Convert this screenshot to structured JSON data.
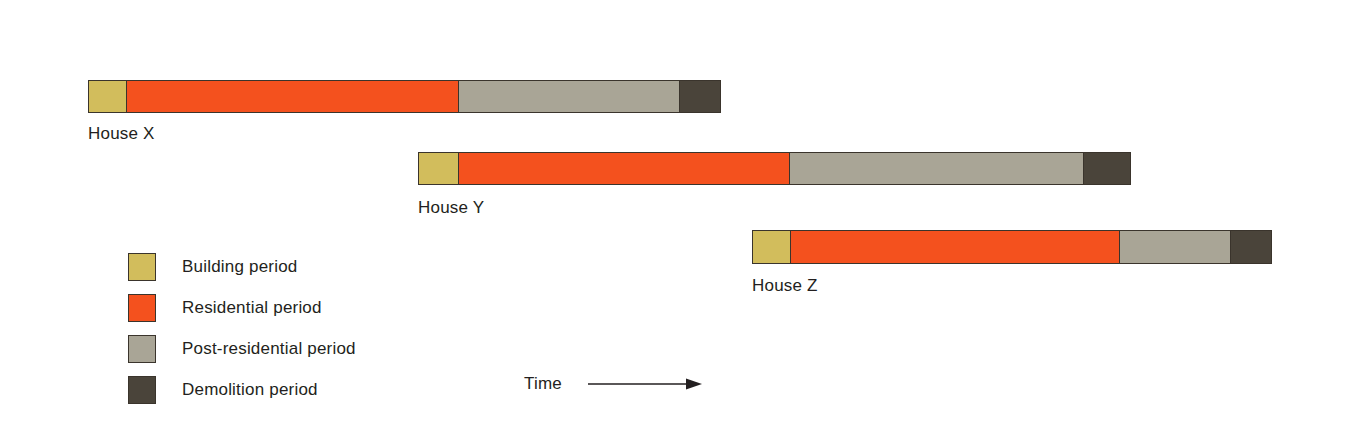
{
  "figure": {
    "time_axis_label": "Time",
    "time_arrow_icon": "right-arrow-icon"
  },
  "colors": {
    "building": "#d2bd5c",
    "residential": "#f4511e",
    "post_residential": "#a9a596",
    "demolition": "#4a443a",
    "outline": "#3a342c",
    "frame": "#5a5a5a",
    "text": "#231f20",
    "background": "#ffffff"
  },
  "legend": {
    "items": [
      {
        "label": "Building period",
        "color": "#d2bd5c",
        "key": "building"
      },
      {
        "label": "Residential period",
        "color": "#f4511e",
        "key": "residential"
      },
      {
        "label": "Post-residential period",
        "color": "#a9a596",
        "key": "post-residential"
      },
      {
        "label": "Demolition period",
        "color": "#4a443a",
        "key": "demolition"
      }
    ]
  },
  "chart_data": {
    "type": "bar",
    "subtype": "stacked-horizontal-timeline",
    "xlabel": "Time",
    "ylabel": "",
    "grid": false,
    "legend_position": "left",
    "axis_units": "pixels",
    "categories": [
      "House X",
      "House Y",
      "House Z"
    ],
    "segment_names": [
      "Building period",
      "Residential period",
      "Post-residential period",
      "Demolition period"
    ],
    "bars": [
      {
        "label": "House X",
        "start": 88,
        "end": 721,
        "top": 80,
        "height": 33,
        "label_x": 88,
        "label_y": 124,
        "segments": [
          {
            "name": "Building period",
            "start": 88,
            "end": 126,
            "width": 38,
            "color": "#d2bd5c"
          },
          {
            "name": "Residential period",
            "start": 126,
            "end": 459,
            "width": 333,
            "color": "#f4511e"
          },
          {
            "name": "Post-residential period",
            "start": 459,
            "end": 681,
            "width": 222,
            "color": "#a9a596"
          },
          {
            "name": "Demolition period",
            "start": 681,
            "end": 721,
            "width": 40,
            "color": "#4a443a"
          }
        ]
      },
      {
        "label": "House Y",
        "start": 418,
        "end": 1131,
        "top": 152,
        "height": 33,
        "label_x": 418,
        "label_y": 198,
        "segments": [
          {
            "name": "Building period",
            "start": 418,
            "end": 458,
            "width": 40,
            "color": "#d2bd5c"
          },
          {
            "name": "Residential period",
            "start": 458,
            "end": 790,
            "width": 332,
            "color": "#f4511e"
          },
          {
            "name": "Post-residential period",
            "start": 790,
            "end": 1085,
            "width": 295,
            "color": "#a9a596"
          },
          {
            "name": "Demolition period",
            "start": 1085,
            "end": 1131,
            "width": 46,
            "color": "#4a443a"
          }
        ]
      },
      {
        "label": "House Z",
        "start": 752,
        "end": 1272,
        "top": 230,
        "height": 34,
        "label_x": 752,
        "label_y": 276,
        "segments": [
          {
            "name": "Building period",
            "start": 752,
            "end": 790,
            "width": 38,
            "color": "#d2bd5c"
          },
          {
            "name": "Residential period",
            "start": 790,
            "end": 1120,
            "width": 330,
            "color": "#f4511e"
          },
          {
            "name": "Post-residential period",
            "start": 1120,
            "end": 1232,
            "width": 112,
            "color": "#a9a596"
          },
          {
            "name": "Demolition period",
            "start": 1232,
            "end": 1272,
            "width": 40,
            "color": "#4a443a"
          }
        ]
      }
    ]
  }
}
